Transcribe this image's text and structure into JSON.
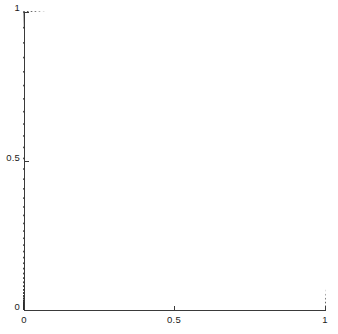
{
  "figure": {
    "background": "#ffffff",
    "foreground": "#1a1a1a",
    "width": 338,
    "height": 334
  },
  "axes": {
    "x": {
      "label": "",
      "ticks": [
        {
          "value": 0,
          "label": "0"
        },
        {
          "value": 0.5,
          "label": "0.5"
        },
        {
          "value": 1,
          "label": "1"
        }
      ],
      "range": [
        0,
        1
      ]
    },
    "y": {
      "label": "",
      "ticks": [
        {
          "value": 0,
          "label": "0"
        },
        {
          "value": 0.5,
          "label": "0.5"
        },
        {
          "value": 1,
          "label": "1"
        }
      ],
      "range": [
        0,
        1
      ]
    }
  },
  "chart_data": {
    "type": "scatter",
    "title": "",
    "xlabel": "",
    "ylabel": "",
    "xlim": [
      0,
      1
    ],
    "ylim": [
      0,
      1
    ],
    "grid": false,
    "legend": null,
    "marker": {
      "shape": "square",
      "size_px": 1.6,
      "color": "#2b2b2b"
    },
    "boundary": {
      "shape": "quarter-circle",
      "radius": 1,
      "center": [
        0,
        0
      ],
      "stroke": "#4a4a4a"
    },
    "grid_spec": {
      "n_angular": 60,
      "n_radial": 44,
      "angle_start_deg": 0,
      "angle_end_deg": 90,
      "radial_clustering": "chebyshev-outer",
      "radial_exponent": 2.35,
      "angular_distribution": "cosine-warped"
    },
    "series": [
      {
        "name": "nodes",
        "color": "#2b2b2b",
        "point_count": 2640
      }
    ]
  }
}
